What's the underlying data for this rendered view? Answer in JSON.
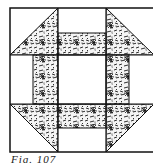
{
  "figure": {
    "caption": "Fig. 107",
    "colors": {
      "background": "#ffffff",
      "line": "#111111",
      "fabric_base": "#f4f4f4",
      "fabric_ink": "#1a1a1a"
    },
    "grid": {
      "x": [
        10,
        58,
        106,
        154
      ],
      "y": [
        8,
        55,
        104,
        152
      ]
    },
    "pieces": [
      {
        "name": "top-left-corner-triangle",
        "shape": "half-square-triangle",
        "fabric": "patterned"
      },
      {
        "name": "top-right-corner-triangle",
        "shape": "half-square-triangle",
        "fabric": "patterned"
      },
      {
        "name": "bottom-left-corner-triangle",
        "shape": "half-square-triangle",
        "fabric": "patterned"
      },
      {
        "name": "bottom-right-corner-triangle",
        "shape": "half-square-triangle",
        "fabric": "patterned"
      },
      {
        "name": "top-bar",
        "shape": "rectangle",
        "fabric": "patterned"
      },
      {
        "name": "bottom-bar",
        "shape": "rectangle",
        "fabric": "patterned"
      },
      {
        "name": "left-bar",
        "shape": "rectangle",
        "fabric": "patterned"
      },
      {
        "name": "right-bar",
        "shape": "rectangle",
        "fabric": "patterned"
      },
      {
        "name": "center-square",
        "shape": "square",
        "fabric": "plain"
      }
    ]
  }
}
